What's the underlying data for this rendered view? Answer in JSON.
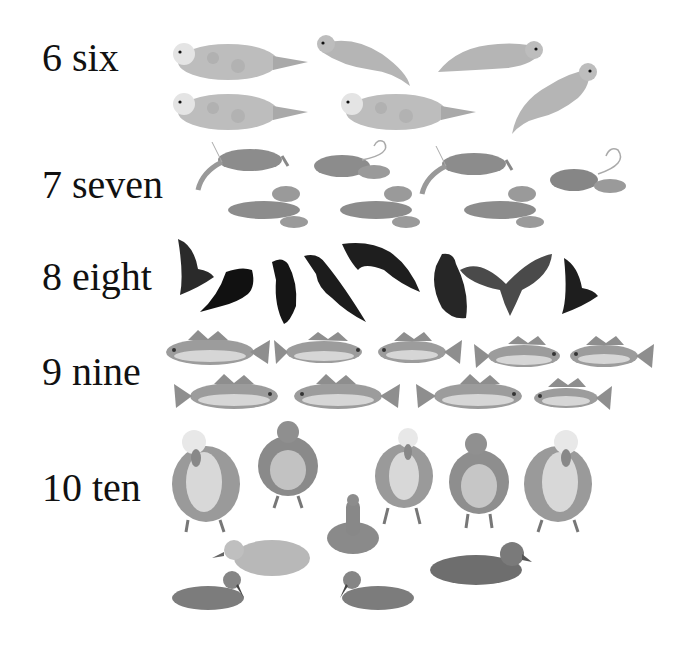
{
  "rows": [
    {
      "number": "6",
      "word": "six",
      "label": "6 six",
      "animal": "seal",
      "count": 6
    },
    {
      "number": "7",
      "word": "seven",
      "label": "7 seven",
      "animal": "lobster",
      "count": 7
    },
    {
      "number": "8",
      "word": "eight",
      "label": "8 eight",
      "animal": "crow",
      "count": 8
    },
    {
      "number": "9",
      "word": "nine",
      "label": "9 nine",
      "animal": "fish",
      "count": 9
    },
    {
      "number": "10",
      "word": "ten",
      "label": "10 ten",
      "animal": "duck",
      "count": 10
    }
  ],
  "colors": {
    "background": "#ffffff",
    "text": "#111111",
    "seal": "#b9b9b9",
    "lobster": "#8a8a8a",
    "crow": "#1e1e1e",
    "fish": "#9a9a9a",
    "duck": "#8f8f8f"
  }
}
